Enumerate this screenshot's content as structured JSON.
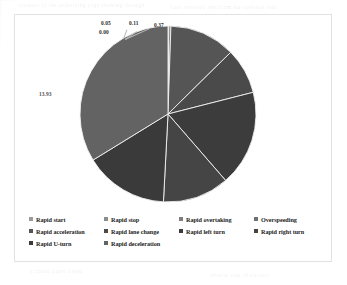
{
  "chart_data": {
    "type": "pie",
    "title": "",
    "labels_visible": [
      "0.05",
      "0.00",
      "0.11",
      "0.37",
      "13.93"
    ],
    "legend_position": "bottom",
    "categories": [
      "Rapid start",
      "Rapid stop",
      "Rapid overtaking",
      "Overspeeding",
      "Rapid acceleration",
      "Rapid lane change",
      "Rapid left turn",
      "Rapid right turn",
      "Rapid U-turn",
      "Rapid deceleration"
    ],
    "slices": [
      {
        "name": "Rapid start",
        "value": 0.05,
        "label": "0.05",
        "color": "#9a9a9a",
        "label_shown": true,
        "label_type": "leader"
      },
      {
        "name": "Rapid stop",
        "value": 0.0,
        "label": "0.00",
        "color": "#8c8c8c",
        "label_shown": true,
        "label_type": "leader"
      },
      {
        "name": "Rapid overtaking",
        "value": 0.11,
        "label": "0.11",
        "color": "#7e7e7e",
        "label_shown": true,
        "label_type": "leader"
      },
      {
        "name": "Overspeeding",
        "value": 0.37,
        "label": "0.37",
        "color": "#6f6f6f",
        "label_shown": true,
        "label_type": "leader"
      },
      {
        "name": "Rapid acceleration",
        "value": 12.1,
        "label": "12.10",
        "color": "#555555",
        "label_shown": false,
        "label_type": "inside"
      },
      {
        "name": "Rapid lane change",
        "value": 8.4,
        "label": "8.40",
        "color": "#4a4a4a",
        "label_shown": false,
        "label_type": "inside"
      },
      {
        "name": "Rapid left turn",
        "value": 17.6,
        "label": "17.60",
        "color": "#3c3c3c",
        "label_shown": false,
        "label_type": "inside"
      },
      {
        "name": "Rapid right turn",
        "value": 12.2,
        "label": "12.20",
        "color": "#454545",
        "label_shown": false,
        "label_type": "inside"
      },
      {
        "name": "Rapid U-turn",
        "value": 15.4,
        "label": "15.40",
        "color": "#3a3a3a",
        "label_shown": false,
        "label_type": "inside"
      },
      {
        "name": "Rapid deceleration",
        "value": 33.77,
        "label": "13.93",
        "color": "#636363",
        "label_shown": true,
        "label_type": "inside"
      }
    ],
    "xlabel": "",
    "ylabel": ""
  },
  "labels": {
    "d1": "0.05",
    "d2": "0.00",
    "d3": "0.11",
    "d4": "0.37",
    "d5": "13.93"
  },
  "legend": {
    "items": [
      {
        "label": "Rapid start",
        "color": "#9a9a9a"
      },
      {
        "label": "Rapid stop",
        "color": "#8c8c8c"
      },
      {
        "label": "Rapid overtaking",
        "color": "#7e7e7e"
      },
      {
        "label": "Overspeeding",
        "color": "#6f6f6f"
      },
      {
        "label": "Rapid acceleration",
        "color": "#555555"
      },
      {
        "label": "Rapid lane change",
        "color": "#4a4a4a"
      },
      {
        "label": "Rapid left turn",
        "color": "#3c3c3c"
      },
      {
        "label": "Rapid right turn",
        "color": "#454545"
      },
      {
        "label": "Rapid U-turn",
        "color": "#3a3a3a"
      },
      {
        "label": "Rapid deceleration",
        "color": "#636363"
      }
    ]
  },
  "background_artifacts": {
    "ghosts": [
      {
        "text": "contents of the underlying page showing through",
        "x": 18,
        "y": 2
      },
      {
        "text": "faint reversed text from the opposite side",
        "x": 150,
        "y": 4
      },
      {
        "text": "scanned paper bleed",
        "x": 30,
        "y": 268
      },
      {
        "text": "reverse side characters",
        "x": 200,
        "y": 272
      }
    ]
  }
}
